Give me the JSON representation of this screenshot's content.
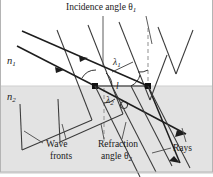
{
  "figure": {
    "width": 213,
    "height": 177,
    "colors": {
      "background": "#ffffff",
      "medium2_fill": "#e3e3e3",
      "line": "#1d1d1d",
      "dashed": "#9a9a9a",
      "border": "#b4b4b4"
    }
  },
  "labels": {
    "incidence_angle": "Incidence angle θ",
    "incidence_angle_sub": "1",
    "n1": "n",
    "n1_sub": "1",
    "n2": "n",
    "n2_sub": "2",
    "lambda1": "λ",
    "lambda1_sub": "1",
    "lambda2": "λ",
    "lambda2_sub": "2",
    "segment_l": "l",
    "wave": "Wave",
    "fronts": "fronts",
    "refraction": "Refraction",
    "angle2": "angle θ",
    "angle2_sub": "2",
    "rays": "Rays"
  },
  "geometry": {
    "interface_y": 86,
    "incidence_point_left": {
      "x": 95,
      "y": 86
    },
    "incidence_point_right": {
      "x": 148,
      "y": 86
    },
    "normal_line_x": 148,
    "normal_line_x_lower": 104
  }
}
